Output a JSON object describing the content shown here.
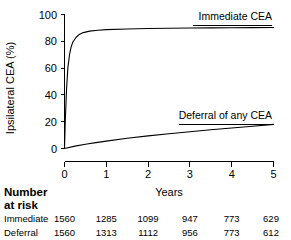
{
  "chart_data": {
    "type": "line",
    "title": "",
    "subtitle": "",
    "xlabel": "Years",
    "ylabel": "Ipsilateral CEA (%)",
    "xlim": [
      0,
      5
    ],
    "ylim": [
      0,
      100
    ],
    "grid": false,
    "legend_position": "inline-curve-labels",
    "x_ticks": [
      "0",
      "1",
      "2",
      "3",
      "4",
      "5"
    ],
    "x_tick_values": [
      0,
      1,
      2,
      3,
      4,
      5
    ],
    "y_ticks": [
      "0",
      "20",
      "40",
      "60",
      "80",
      "100"
    ],
    "y_tick_values": [
      0,
      20,
      40,
      60,
      80,
      100
    ],
    "series": [
      {
        "name": "Immediate CEA",
        "label": "Immediate CEA",
        "color": "#000000",
        "x": [
          0,
          0.02,
          0.05,
          0.08,
          0.12,
          0.16,
          0.2,
          0.28,
          0.35,
          0.45,
          0.6,
          0.8,
          1.0,
          1.5,
          2.0,
          2.5,
          3.0,
          3.5,
          4.0,
          4.5,
          5.0
        ],
        "values": [
          0,
          22,
          45,
          60,
          70,
          76,
          79.5,
          83,
          85,
          86.5,
          87.6,
          88.3,
          88.7,
          89.2,
          89.5,
          89.7,
          89.9,
          90.0,
          90.1,
          90.2,
          90.3
        ]
      },
      {
        "name": "Deferral of any CEA",
        "label": "Deferral of any CEA",
        "color": "#000000",
        "x": [
          0,
          0.25,
          0.5,
          0.75,
          1.0,
          1.5,
          2.0,
          2.5,
          3.0,
          3.5,
          4.0,
          4.5,
          5.0
        ],
        "values": [
          0,
          1.8,
          3.2,
          4.4,
          5.5,
          7.6,
          9.4,
          11.0,
          12.5,
          14.0,
          15.3,
          16.6,
          18.0
        ]
      }
    ]
  },
  "risk_table": {
    "heading_line1": "Number",
    "heading_line2": "at risk",
    "rows": [
      {
        "label": "Immediate",
        "values": [
          "1560",
          "1285",
          "1099",
          "947",
          "773",
          "629"
        ]
      },
      {
        "label": "Deferral",
        "values": [
          "1560",
          "1313",
          "1112",
          "956",
          "773",
          "612"
        ]
      }
    ]
  }
}
